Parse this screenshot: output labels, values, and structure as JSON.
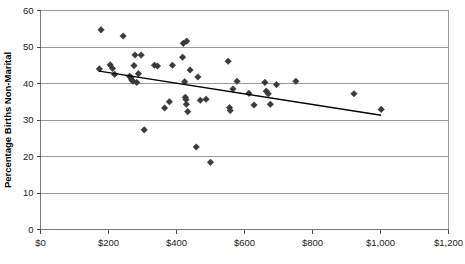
{
  "figure": {
    "caption": ""
  },
  "chart_data": {
    "type": "scatter",
    "title": "",
    "xlabel": "",
    "ylabel": "Percentage Births Non-Marital",
    "xlim": [
      0,
      1200
    ],
    "ylim": [
      0,
      60
    ],
    "grid": true,
    "legend": null,
    "x_tick_labels": [
      "$0",
      "$200",
      "$400",
      "$600",
      "$800",
      "$1,000",
      "$1,200"
    ],
    "x_ticks": [
      0,
      200,
      400,
      600,
      800,
      1000,
      1200
    ],
    "y_tick_labels": [
      "0",
      "10",
      "20",
      "30",
      "40",
      "50",
      "60"
    ],
    "y_ticks": [
      0,
      10,
      20,
      30,
      40,
      50,
      60
    ],
    "marker": "diamond",
    "marker_color": "#3b3b3b",
    "points": [
      {
        "x": 173,
        "y": 44.0
      },
      {
        "x": 178,
        "y": 54.7
      },
      {
        "x": 205,
        "y": 45.1
      },
      {
        "x": 212,
        "y": 44.1
      },
      {
        "x": 218,
        "y": 42.5
      },
      {
        "x": 243,
        "y": 53.0
      },
      {
        "x": 262,
        "y": 42.0
      },
      {
        "x": 266,
        "y": 41.6
      },
      {
        "x": 268,
        "y": 41.0
      },
      {
        "x": 272,
        "y": 40.6
      },
      {
        "x": 275,
        "y": 44.9
      },
      {
        "x": 278,
        "y": 47.8
      },
      {
        "x": 283,
        "y": 40.3
      },
      {
        "x": 288,
        "y": 42.7
      },
      {
        "x": 296,
        "y": 47.8
      },
      {
        "x": 305,
        "y": 27.3
      },
      {
        "x": 335,
        "y": 45.0
      },
      {
        "x": 344,
        "y": 44.8
      },
      {
        "x": 365,
        "y": 33.3
      },
      {
        "x": 379,
        "y": 35.0
      },
      {
        "x": 388,
        "y": 45.0
      },
      {
        "x": 418,
        "y": 47.2
      },
      {
        "x": 420,
        "y": 51.0
      },
      {
        "x": 424,
        "y": 40.5
      },
      {
        "x": 426,
        "y": 36.2
      },
      {
        "x": 428,
        "y": 35.6
      },
      {
        "x": 429,
        "y": 34.3
      },
      {
        "x": 430,
        "y": 51.6
      },
      {
        "x": 433,
        "y": 32.3
      },
      {
        "x": 440,
        "y": 43.7
      },
      {
        "x": 458,
        "y": 22.6
      },
      {
        "x": 463,
        "y": 41.8
      },
      {
        "x": 470,
        "y": 35.4
      },
      {
        "x": 487,
        "y": 35.7
      },
      {
        "x": 500,
        "y": 18.4
      },
      {
        "x": 552,
        "y": 46.1
      },
      {
        "x": 556,
        "y": 33.4
      },
      {
        "x": 558,
        "y": 32.6
      },
      {
        "x": 566,
        "y": 38.5
      },
      {
        "x": 578,
        "y": 40.6
      },
      {
        "x": 613,
        "y": 37.3
      },
      {
        "x": 628,
        "y": 34.1
      },
      {
        "x": 660,
        "y": 40.3
      },
      {
        "x": 664,
        "y": 37.9
      },
      {
        "x": 670,
        "y": 37.2
      },
      {
        "x": 676,
        "y": 34.3
      },
      {
        "x": 694,
        "y": 39.7
      },
      {
        "x": 751,
        "y": 40.6
      },
      {
        "x": 922,
        "y": 37.2
      },
      {
        "x": 1002,
        "y": 32.9
      }
    ],
    "trendline": {
      "x0": 173,
      "y0": 43.4,
      "x1": 1002,
      "y1": 31.3
    }
  }
}
